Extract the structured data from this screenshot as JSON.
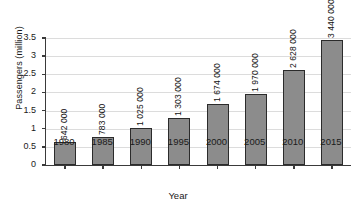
{
  "chart_data": {
    "type": "bar",
    "title": "",
    "xlabel": "Year",
    "ylabel": "Passengers (million)",
    "categories": [
      "1980",
      "1985",
      "1990",
      "1995",
      "2000",
      "2005",
      "2010",
      "2015"
    ],
    "values": [
      0.642,
      0.783,
      1.025,
      1.303,
      1.674,
      1.97,
      2.628,
      3.44
    ],
    "bar_labels": [
      "642 000",
      "783 000",
      "1 025 000",
      "1 303 000",
      "1 674 000",
      "1 970 000",
      "2 628 000",
      "3 440 000"
    ],
    "ylim": [
      0,
      3.5
    ],
    "yticks": [
      "0",
      "0.5",
      "1",
      "1.5",
      "2",
      "2.5",
      "3",
      "3.5"
    ],
    "ytick_values": [
      0,
      0.5,
      1,
      1.5,
      2,
      2.5,
      3,
      3.5
    ],
    "grid": true,
    "grid_axis": "y",
    "legend": "none",
    "bar_color": "#8c8c8c",
    "bar_edge_color": "#2b2b2b",
    "grid_color": "#dcdcdc",
    "axis_color": "#3a3a3a",
    "text_color": "#1a1a1a",
    "background": "#ffffff",
    "value_label_rotation": "90"
  }
}
